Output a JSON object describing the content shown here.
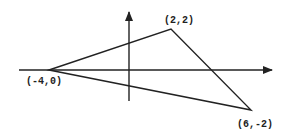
{
  "diagram": {
    "type": "coordinate-plane-triangle",
    "vertices": [
      {
        "label": "(-4,0)",
        "x": -4,
        "y": 0
      },
      {
        "label": "(2,2)",
        "x": 2,
        "y": 2
      },
      {
        "label": "(6,-2)",
        "x": 6,
        "y": -2
      }
    ],
    "labels": {
      "v1": "(-4,0)",
      "v2": "(2,2)",
      "v3": "(6,-2)"
    },
    "stroke_color": "#222222"
  }
}
